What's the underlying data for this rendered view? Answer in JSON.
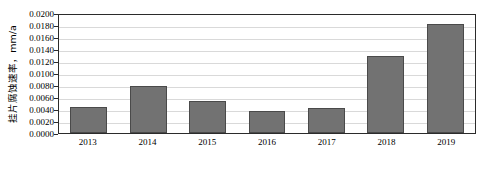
{
  "chart_data": {
    "type": "bar",
    "title": "",
    "xlabel": "",
    "ylabel": "挂片腐蚀速率，mm/a",
    "categories": [
      "2013",
      "2014",
      "2015",
      "2016",
      "2017",
      "2018",
      "2019"
    ],
    "values": [
      0.0044,
      0.0079,
      0.0053,
      0.0036,
      0.0041,
      0.0128,
      0.0182
    ],
    "ylim": [
      0.0,
      0.02
    ],
    "ytick_step": 0.002,
    "ytick_labels": [
      "0.0200",
      "0.0180",
      "0.0160",
      "0.0140",
      "0.0120",
      "0.0100",
      "0.0080",
      "0.0060",
      "0.0040",
      "0.0020",
      "0.0000"
    ],
    "ytick_values": [
      0.02,
      0.018,
      0.016,
      0.014,
      0.012,
      0.01,
      0.008,
      0.006,
      0.004,
      0.002,
      0
    ],
    "grid": true,
    "grid_axis": "y",
    "legend": false,
    "legend_position": "none",
    "series": [
      {
        "name": "挂片腐蚀速率",
        "values": [
          0.0044,
          0.0079,
          0.0053,
          0.0036,
          0.0041,
          0.0128,
          0.0182
        ]
      }
    ],
    "colors": {
      "bar_fill": "#727272",
      "bar_border": "#4a4a4a",
      "gridline": "#d9d9d9",
      "axis": "#2b2b2b",
      "background": "#ffffff",
      "text": "#000000"
    }
  }
}
